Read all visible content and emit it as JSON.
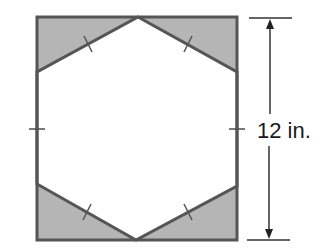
{
  "figure": {
    "dimension_label": "12 in.",
    "dimension_measures": "square side length",
    "colors": {
      "stroke": "#555555",
      "shade": "#b5b5b5",
      "background": "#ffffff",
      "text": "#1a1a1a"
    },
    "square": {
      "x1": 37,
      "y1": 17,
      "x2": 237,
      "y2": 240
    },
    "hexagon_vertices": [
      [
        138,
        17
      ],
      [
        237,
        72
      ],
      [
        237,
        186
      ],
      [
        136,
        240
      ],
      [
        37,
        184
      ],
      [
        37,
        72
      ]
    ],
    "congruence_tick_count": 6
  }
}
